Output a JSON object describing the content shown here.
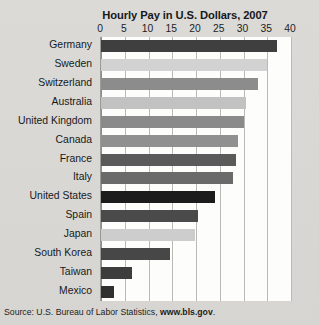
{
  "chart_data": {
    "type": "bar",
    "orientation": "horizontal",
    "title": "Hourly Pay in U.S. Dollars, 2007",
    "xlabel": "",
    "ylabel": "",
    "xlim": [
      0,
      40
    ],
    "xticks": [
      0,
      5,
      10,
      15,
      20,
      25,
      30,
      35,
      40
    ],
    "xtick_labels": [
      "0",
      "5",
      "10",
      "15",
      "20",
      "25",
      "30",
      "35",
      "40"
    ],
    "grid": "vertical",
    "legend": "none",
    "categories": [
      "Germany",
      "Sweden",
      "Switzerland",
      "Australia",
      "United Kingdom",
      "Canada",
      "France",
      "Italy",
      "United States",
      "Spain",
      "Japan",
      "South Korea",
      "Taiwan",
      "Mexico"
    ],
    "values": [
      37.0,
      35.0,
      33.0,
      30.5,
      30.0,
      28.9,
      28.5,
      27.7,
      24.0,
      20.5,
      19.8,
      14.5,
      6.5,
      2.7
    ],
    "bar_colors": [
      "#3f3f3f",
      "#d2d2d2",
      "#8c8c8c",
      "#c2c2c2",
      "#8a8a8a",
      "#909090",
      "#5a5a5a",
      "#6a6a6a",
      "#1c1c1c",
      "#4a4a4a",
      "#cdcdcd",
      "#474747",
      "#3d3d3d",
      "#303030"
    ],
    "highlight_category": "United States",
    "plot_background": "#fdfdfc",
    "gridline_color": "#b9b9b7",
    "axis_color": "#8d8d8b"
  },
  "source": {
    "prefix": "Source: U.S. Bureau of Labor Statistics, ",
    "url": "www.bls.gov",
    "suffix": "."
  }
}
